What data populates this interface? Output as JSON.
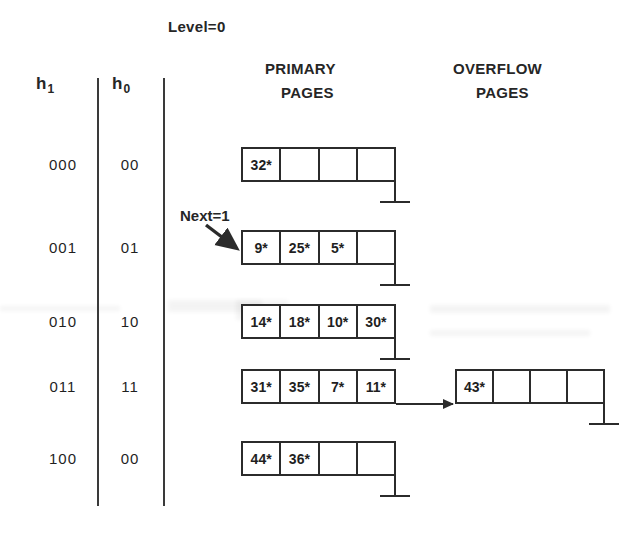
{
  "diagram": {
    "title": "Level=0",
    "next_label": "Next=1",
    "columns": {
      "h1": "h",
      "h1_sub": "1",
      "h0": "h",
      "h0_sub": "0"
    },
    "section_headings": {
      "primary_line1": "PRIMARY",
      "primary_line2": "PAGES",
      "overflow_line1": "OVERFLOW",
      "overflow_line2": "PAGES"
    },
    "ink_color": "#2b2b2b"
  },
  "rows": [
    {
      "h1": "000",
      "h0": "00",
      "primary": [
        "32*",
        "",
        "",
        ""
      ],
      "has_null_pointer": true,
      "overflow": null
    },
    {
      "h1": "001",
      "h0": "01",
      "primary": [
        "9*",
        "25*",
        "5*",
        ""
      ],
      "has_null_pointer": true,
      "overflow": null
    },
    {
      "h1": "010",
      "h0": "10",
      "primary": [
        "14*",
        "18*",
        "10*",
        "30*"
      ],
      "has_null_pointer": true,
      "overflow": null
    },
    {
      "h1": "011",
      "h0": "11",
      "primary": [
        "31*",
        "35*",
        "7*",
        "11*"
      ],
      "has_null_pointer": false,
      "overflow": {
        "cells": [
          "43*",
          "",
          "",
          ""
        ],
        "has_null_pointer": true
      }
    },
    {
      "h1": "100",
      "h0": "00",
      "primary": [
        "44*",
        "36*",
        "",
        ""
      ],
      "has_null_pointer": true,
      "overflow": null
    }
  ]
}
